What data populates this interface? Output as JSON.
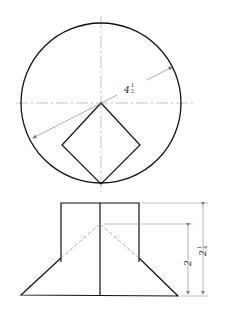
{
  "drawing": {
    "type": "orthographic projection — square prism intersecting cone",
    "top_view": {
      "radius_label_main": "4",
      "radius_label_frac_num": "1",
      "radius_label_frac_den": "2"
    },
    "front_view": {
      "height_inner_label": "2",
      "height_outer_label_main": "2",
      "height_outer_label_frac_num": "1",
      "height_outer_label_frac_den": "4"
    },
    "colors": {
      "object_line": "#111111",
      "thin_line": "#999999"
    }
  }
}
